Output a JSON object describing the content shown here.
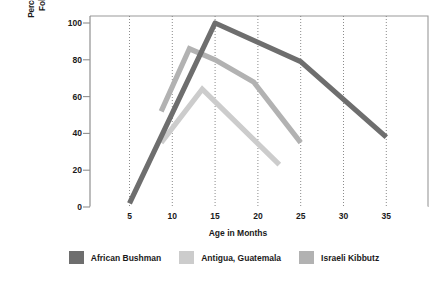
{
  "chart_data": {
    "type": "line",
    "title": "",
    "xlabel": "Age in Months",
    "ylabel": "Percentage of Children Who Cried Following Departure of Mother",
    "ylabel_line1": "Percentage of Children Who Cried",
    "ylabel_line2": "Following Departure of Mother",
    "xlim": [
      3,
      38
    ],
    "ylim": [
      0,
      105
    ],
    "xticks": [
      5,
      10,
      15,
      20,
      25,
      30,
      35
    ],
    "yticks": [
      0,
      20,
      40,
      60,
      80,
      100
    ],
    "xtick_labels": [
      "5",
      "10",
      "15",
      "20",
      "25",
      "30",
      "35"
    ],
    "ytick_labels": [
      "0",
      "20",
      "40",
      "60",
      "80",
      "100"
    ],
    "grid": "vertical-dotted",
    "legend_position": "below",
    "series": [
      {
        "name": "African Bushman",
        "color": "#6e6e6e",
        "x": [
          5,
          15,
          25,
          35
        ],
        "values": [
          2,
          100,
          79,
          38
        ]
      },
      {
        "name": "Antigua, Guatemala",
        "color": "#cccccc",
        "x": [
          8.7,
          13.5,
          22.5
        ],
        "values": [
          35,
          64,
          23
        ]
      },
      {
        "name": "Israeli Kibbutz",
        "color": "#b2b2b2",
        "x": [
          8.7,
          12,
          15,
          19.5,
          25
        ],
        "values": [
          52,
          86,
          80,
          68,
          35
        ]
      }
    ]
  },
  "axes": {
    "y_title_line1": "Percentage of Children Who Cried",
    "y_title_line2": "Following Departure of Mother",
    "x_title": "Age in Months"
  },
  "legend": {
    "items": [
      {
        "label": "African Bushman",
        "color": "#6e6e6e"
      },
      {
        "label": "Antigua, Guatemala",
        "color": "#cccccc"
      },
      {
        "label": "Israeli Kibbutz",
        "color": "#b2b2b2"
      }
    ]
  },
  "ticks": {
    "y": [
      {
        "label": "100",
        "value": 100
      },
      {
        "label": "80",
        "value": 80
      },
      {
        "label": "60",
        "value": 60
      },
      {
        "label": "40",
        "value": 40
      },
      {
        "label": "20",
        "value": 20
      },
      {
        "label": "0",
        "value": 0
      }
    ],
    "x": [
      {
        "label": "5",
        "value": 5
      },
      {
        "label": "10",
        "value": 10
      },
      {
        "label": "15",
        "value": 15
      },
      {
        "label": "20",
        "value": 20
      },
      {
        "label": "25",
        "value": 25
      },
      {
        "label": "30",
        "value": 30
      },
      {
        "label": "35",
        "value": 35
      }
    ]
  },
  "colors": {
    "plot_border": "#9a9a9a",
    "gridline": "#8a8a8a",
    "axis_text": "#1a1a1a",
    "background": "#ffffff"
  }
}
